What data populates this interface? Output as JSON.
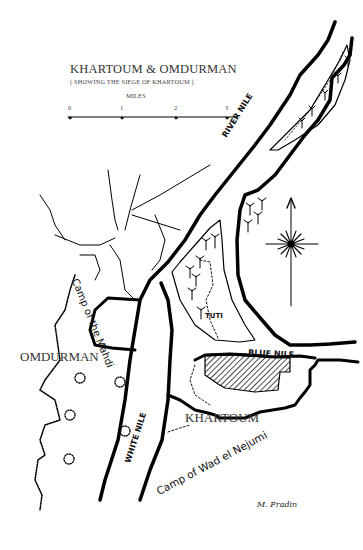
{
  "map": {
    "title": "KHARTOUM & OMDURMAN",
    "subtitle": "( SHOWING THE SIEGE OF KHARTOUM )",
    "scale": {
      "unit_label": "MILES",
      "ticks": [
        "0",
        "1",
        "2",
        "3"
      ]
    },
    "labels": {
      "omdurman": "OMDURMAN",
      "khartoum": "KHARTOUM",
      "tuti": "TUTI",
      "river_nile": "RIVER NILE",
      "blue_nile": "BLUE NILE",
      "white_nile": "WHITE NILE",
      "camp_mahdi": "Camp of the Mahdi",
      "camp_wad": "Camp of Wad el Nejumi"
    },
    "signature": "M. Fradin",
    "features": {
      "compass": "north-arrow-compass-rose",
      "palm_trees": "palm-tree-icon",
      "siege_area": "hatched-area"
    }
  }
}
